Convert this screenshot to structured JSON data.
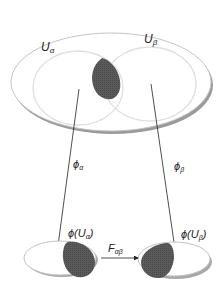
{
  "diagram": {
    "title": "",
    "labels": {
      "u_alpha": "U",
      "u_alpha_sub": "α",
      "u_beta": "U",
      "u_beta_sub": "β",
      "phi_alpha": "ϕ",
      "phi_alpha_sub": "α",
      "phi_beta": "ϕ",
      "phi_beta_sub": "β",
      "image_alpha": "ϕ(U",
      "image_alpha_sub": "α",
      "image_alpha_close": ")",
      "image_beta": "ϕ(U",
      "image_beta_sub": "β",
      "image_beta_close": ")",
      "transition": "F",
      "transition_sub": "αβ"
    },
    "colors": {
      "background": "#ffffff",
      "outline": "#bdbdbd",
      "shadow": "#9a9a9a",
      "overlap_fill": "#555555",
      "arrow": "#222222"
    }
  }
}
